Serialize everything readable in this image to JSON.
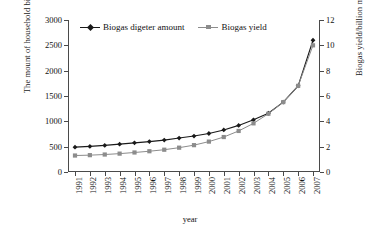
{
  "chart_data": {
    "type": "line",
    "title": "",
    "xlabel": "year",
    "ylabel": "The mount of household biogas digester",
    "ylabel_right": "Biogas yield/billion m",
    "ylabel_right_sup": "3",
    "categories": [
      "1991",
      "1992",
      "1993",
      "1994",
      "1995",
      "1996",
      "1997",
      "1998",
      "1999",
      "2000",
      "2001",
      "2002",
      "2003",
      "2004",
      "2005",
      "2006",
      "2007"
    ],
    "ylim": [
      0,
      3000
    ],
    "yticks": [
      "0",
      "500",
      "1000",
      "1500",
      "2000",
      "2500",
      "3000"
    ],
    "ylim_right": [
      0,
      12
    ],
    "yticks_right": [
      "0",
      "2",
      "4",
      "6",
      "8",
      "10",
      "12"
    ],
    "grid": false,
    "legend_position": "top-left",
    "series": [
      {
        "name": "Biogas digeter amount",
        "axis": "left",
        "color": "#1a1a1a",
        "marker": "diamond",
        "values": [
          490,
          505,
          525,
          550,
          575,
          600,
          630,
          670,
          710,
          760,
          830,
          920,
          1030,
          1160,
          1380,
          1700,
          2600
        ]
      },
      {
        "name": "Biogas yield",
        "axis": "right",
        "color": "#8c8c8c",
        "marker": "square",
        "values": [
          1.3,
          1.33,
          1.38,
          1.45,
          1.54,
          1.64,
          1.76,
          1.92,
          2.12,
          2.4,
          2.76,
          3.24,
          3.84,
          4.6,
          5.52,
          6.8,
          10.0
        ]
      }
    ]
  },
  "legend": {
    "items": [
      {
        "label": "Biogas digeter amount"
      },
      {
        "label": "Biogas yield"
      }
    ]
  }
}
